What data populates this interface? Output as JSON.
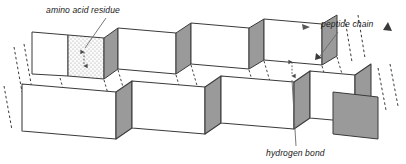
{
  "figure": {
    "background_color": "#ffffff",
    "width": 406,
    "height": 164
  },
  "labels": {
    "amino_acid_residue": "amino acid residue",
    "peptide_chain": "peptide chain",
    "hydrogen_bond": "hydrogen bond"
  },
  "colors": {
    "outline": "#3a3a3a",
    "face_light": "#ffffff",
    "face_shaded": "#9a9a9a",
    "face_stippled": "#f2f2f2",
    "leader_line": "#6a6a6a",
    "dashed_edge": "#3a3a3a",
    "text": "#1a1a1a"
  },
  "structure": {
    "type": "pleated sheet",
    "rows": 2,
    "pleats_per_row": 4,
    "face_shading_pattern": [
      "light",
      "shaded"
    ],
    "stippled_panel_index": 1
  },
  "annotations": [
    {
      "name": "amino-acid-residue",
      "label": "amino acid residue",
      "text_x": 46,
      "text_y": 13,
      "leader": "M 106,16 L 83,54"
    },
    {
      "name": "peptide-chain",
      "label": "peptide chain",
      "text_x": 320,
      "text_y": 27,
      "leader": "M 340,31 L 320,55"
    },
    {
      "name": "hydrogen-bond",
      "label": "hydrogen bond",
      "text_x": 265,
      "text_y": 155,
      "leader": "M 296,146 L 292,70"
    }
  ]
}
